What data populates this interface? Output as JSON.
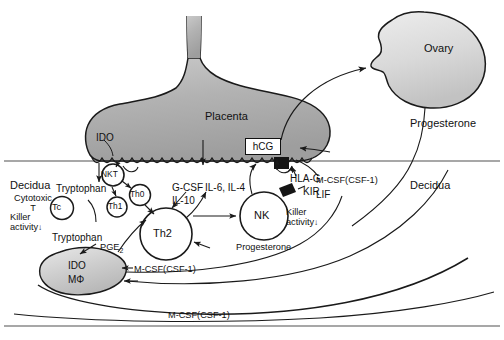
{
  "figure": {
    "compartments": {
      "decidua_left": "Decidua",
      "decidua_right": "Decidua"
    },
    "organs": {
      "placenta": "Placenta",
      "ovary": "Ovary"
    },
    "placenta_enzyme": "IDO",
    "hcg_box": "hCG",
    "cells": [
      {
        "id": "tc",
        "label": "Tc",
        "shape": "circle"
      },
      {
        "id": "nkt",
        "label": "NKT",
        "shape": "circle"
      },
      {
        "id": "th0",
        "label": "Th0",
        "shape": "circle"
      },
      {
        "id": "th1",
        "label": "Th1",
        "shape": "circle"
      },
      {
        "id": "th2",
        "label": "Th2",
        "shape": "circle"
      },
      {
        "id": "nk",
        "label": "NK",
        "shape": "circle"
      },
      {
        "id": "mac",
        "label_top": "IDO",
        "label_bottom": "MΦ",
        "shape": "blob"
      }
    ],
    "annotations": {
      "cytotoxic_t": "Cytotoxic\nT",
      "killer_activity_left": "Killer\nactivity",
      "killer_activity_nk": "Killer\nactivity",
      "killer_arrow": "↓",
      "tryptophan_upper": "Tryptophan",
      "tryptophan_lower": "Tryptophan",
      "pge2": "PGE",
      "pge2_sub": "2",
      "gcsf": "G-CSF",
      "il10": "IL-10",
      "il6_il4": "IL-6, IL-4",
      "hla_g": "HLA-G",
      "kir": "KIR",
      "mcsf_upper": "M-CSF(CSF-1)",
      "lif": "LIF",
      "mcsf_mid": "M-CSF(CSF-1)",
      "mcsf_bottom": "M-CSF(CSF-1)",
      "progesterone_nk": "Progesterone",
      "progesterone_ovary": "Progesterone"
    },
    "colors": {
      "placenta_fill": "#b4b4b4",
      "placenta_stroke": "#1a1a1a",
      "ovary_fill": "#d8d8d8",
      "macrophage_fill": "#cfcfcf",
      "receptor_black": "#151515",
      "frame_line": "#8a8a8a",
      "text": "#111111"
    }
  }
}
